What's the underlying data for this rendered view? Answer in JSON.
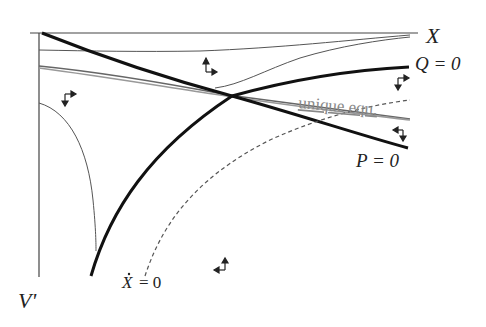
{
  "diagram": {
    "type": "phase-diagram",
    "axes": {
      "horizontal_label": "X",
      "vertical_label": "V'"
    },
    "curves": [
      {
        "id": "Q0",
        "label": "Q = 0",
        "style": "thick-solid",
        "color": "#111111"
      },
      {
        "id": "P0",
        "label": "P = 0",
        "style": "thick-solid",
        "color": "#111111"
      },
      {
        "id": "Xdot0",
        "label": "Ẋ = 0",
        "style": "dashed",
        "color": "#555555"
      },
      {
        "id": "stable-path",
        "label": "unique equ.",
        "style": "gray-double",
        "color": "#888888"
      },
      {
        "id": "trajectory-top",
        "label": "",
        "style": "thin",
        "color": "#555555"
      },
      {
        "id": "trajectory-upper-right",
        "label": "",
        "style": "thin",
        "color": "#555555"
      },
      {
        "id": "trajectory-left",
        "label": "",
        "style": "thin",
        "color": "#555555"
      }
    ],
    "labels": {
      "x_axis": "X",
      "v_axis": "V'",
      "q_zero": "Q = 0",
      "p_zero": "P = 0",
      "xdot_zero_lhs": "X",
      "xdot_zero_rhs": "= 0",
      "unique_equilibrium": "unique equ."
    },
    "direction_arrows": [
      {
        "region": "upper-middle",
        "vertical": "up",
        "horizontal": "right"
      },
      {
        "region": "left",
        "vertical": "down",
        "horizontal": "right"
      },
      {
        "region": "right-upper",
        "vertical": "down",
        "horizontal": "right"
      },
      {
        "region": "right-lower",
        "vertical": "down",
        "horizontal": "left"
      },
      {
        "region": "bottom",
        "vertical": "up",
        "horizontal": "left"
      }
    ]
  }
}
